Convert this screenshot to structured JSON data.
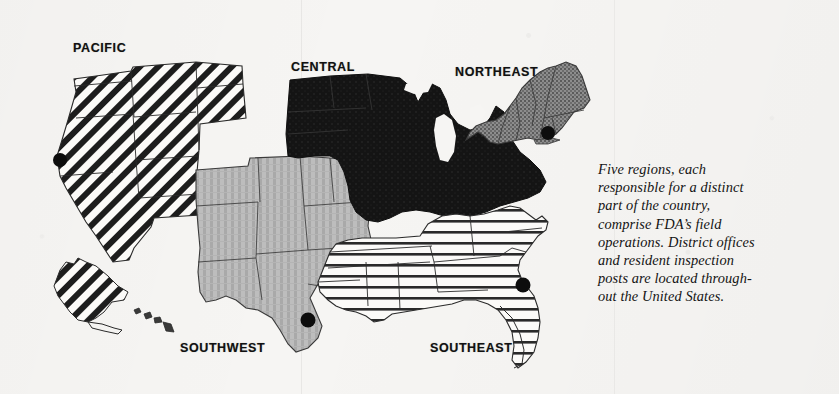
{
  "figure": {
    "kind": "map",
    "background_color": "#f6f5f3",
    "ink_color": "#111111"
  },
  "labels": [
    {
      "key": "pacific",
      "text": "PACIFIC",
      "x": 73,
      "y": 41
    },
    {
      "key": "central",
      "text": "CENTRAL",
      "x": 291,
      "y": 60
    },
    {
      "key": "northeast",
      "text": "NORTHEAST",
      "x": 455,
      "y": 65
    },
    {
      "key": "southwest",
      "text": "SOUTHWEST",
      "x": 180,
      "y": 341
    },
    {
      "key": "southeast",
      "text": "SOUTHEAST",
      "x": 430,
      "y": 341
    }
  ],
  "regions": [
    {
      "key": "pacific",
      "name": "Pacific",
      "fill_style": "diagonal-stripes",
      "fill_color": "#1a1a1a",
      "states": "WA, OR, CA, NV, ID, MT, WY, UT, AZ-west, AK, HI"
    },
    {
      "key": "central",
      "name": "Central",
      "fill_style": "solid-black",
      "fill_color": "#121212",
      "states": "ND, SD, MN, WI, MI, IL, IN, OH, IA-north"
    },
    {
      "key": "northeast",
      "name": "Northeast",
      "fill_style": "stipple-gray",
      "fill_color": "#6e6e6e",
      "states": "ME, NH, VT, MA, RI, CT, NY, NJ, PA"
    },
    {
      "key": "southwest",
      "name": "Southwest",
      "fill_style": "vertical-stripes",
      "fill_color": "#b5b5b5",
      "states": "AZ, NM, CO, KS, NE, OK, TX, MO, AR-west"
    },
    {
      "key": "southeast",
      "name": "Southeast",
      "fill_style": "horizontal-lines",
      "fill_color": "#2b2b2b",
      "states": "KY, TN, NC, SC, GA, FL, AL, MS, LA, VA, WV, MD, DE"
    }
  ],
  "markers": [
    {
      "key": "pacific-office",
      "region": "pacific",
      "x": 60,
      "y": 160
    },
    {
      "key": "southwest-office",
      "region": "southwest",
      "x": 308,
      "y": 320
    },
    {
      "key": "southeast-office",
      "region": "southeast",
      "x": 523,
      "y": 285
    },
    {
      "key": "northeast-office",
      "region": "northeast",
      "x": 548,
      "y": 133
    }
  ],
  "caption": {
    "lines": [
      "Five regions, each",
      "responsible for a distinct",
      "part of the country,",
      "comprise FDA’s field",
      "operations. District offices",
      "and resident inspection",
      "posts are located through-",
      "out the United States."
    ],
    "full_text": "Five regions, each responsible for a distinct part of the country, comprise FDA’s field operations. District offices and resident inspection posts are located throughout the United States."
  }
}
